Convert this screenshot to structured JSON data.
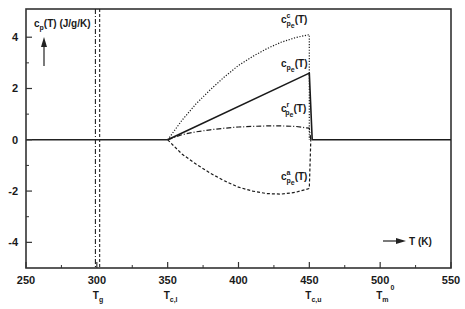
{
  "chart_data": {
    "type": "line",
    "title": "",
    "xlabel": "T (K)",
    "ylabel": "c_p(T) (J/g/K)",
    "xlim": [
      250,
      550
    ],
    "ylim": [
      -5,
      5.1
    ],
    "grid": false,
    "x_ticks": [
      250,
      300,
      350,
      400,
      450,
      500,
      550
    ],
    "x_minor_ticks": [
      275,
      325,
      375,
      425,
      475,
      525
    ],
    "y_ticks": [
      -4,
      -2,
      0,
      2,
      4
    ],
    "y_minor_ticks": [
      -3,
      -1,
      1,
      3
    ],
    "x_tick_labels": [
      "250",
      "300",
      "350",
      "400",
      "450",
      "500",
      "550"
    ],
    "y_tick_labels": [
      "-4",
      "-2",
      "0",
      "2",
      "4"
    ],
    "special_temperatures": [
      {
        "label": "T",
        "sub": "g",
        "sup": "",
        "x": 300
      },
      {
        "label": "T",
        "sub": "c,l",
        "sup": "",
        "x": 350
      },
      {
        "label": "T",
        "sub": "c,u",
        "sup": "",
        "x": 450
      },
      {
        "label": "T",
        "sub": "m",
        "sup": "0",
        "x": 500
      }
    ],
    "vertical_lines": [
      {
        "x": 299,
        "style": "dashdot"
      },
      {
        "x": 302,
        "style": "dashed"
      }
    ],
    "series": [
      {
        "name": "c_pe^c(T)",
        "label_main": "c",
        "label_sup": "c",
        "label_sub": "p",
        "label_subsub": "e",
        "label_suffix": "(T)",
        "style": "dotted",
        "label_at": [
          430,
          4.55
        ],
        "x": [
          350,
          360,
          370,
          380,
          390,
          400,
          410,
          420,
          430,
          440,
          450,
          450
        ],
        "y": [
          0,
          0.75,
          1.4,
          1.95,
          2.45,
          2.9,
          3.25,
          3.55,
          3.8,
          3.98,
          4.1,
          0
        ]
      },
      {
        "name": "c_pe(T)",
        "label_main": "c",
        "label_sup": "",
        "label_sub": "p",
        "label_subsub": "e",
        "label_suffix": "(T)",
        "style": "solid",
        "label_at": [
          430,
          2.85
        ],
        "x": [
          350,
          450,
          452,
          452,
          550
        ],
        "y": [
          0,
          2.6,
          0,
          0,
          0
        ]
      },
      {
        "name": "c_pe^r(T)",
        "label_main": "c",
        "label_sup": "r",
        "label_sub": "p",
        "label_subsub": "e",
        "label_suffix": "(T)",
        "style": "dashdot",
        "label_at": [
          430,
          1.1
        ],
        "x": [
          350,
          360,
          370,
          380,
          390,
          400,
          410,
          420,
          430,
          440,
          450,
          451
        ],
        "y": [
          0,
          0.2,
          0.31,
          0.39,
          0.45,
          0.5,
          0.52,
          0.54,
          0.54,
          0.52,
          0.45,
          0
        ]
      },
      {
        "name": "c_pe^a(T)",
        "label_main": "c",
        "label_sup": "a",
        "label_sub": "p",
        "label_subsub": "e",
        "label_suffix": "(T)",
        "style": "dashed",
        "label_at": [
          430,
          -1.55
        ],
        "x": [
          350,
          360,
          370,
          380,
          390,
          400,
          410,
          420,
          430,
          440,
          450,
          451
        ],
        "y": [
          0,
          -0.55,
          -0.95,
          -1.3,
          -1.6,
          -1.85,
          -2.0,
          -2.1,
          -2.12,
          -2.05,
          -1.9,
          0
        ]
      }
    ],
    "annotations": {
      "ylabel_arrow": "up",
      "xlabel_arrow": "right"
    }
  }
}
